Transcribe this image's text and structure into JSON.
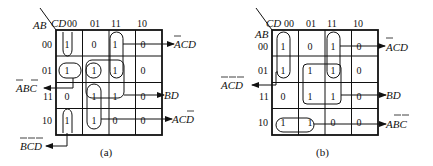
{
  "figure": {
    "maps": [
      {
        "id": "a",
        "caption": "(a)",
        "row_var": "AB",
        "col_var": "CD",
        "col_labels": [
          "00",
          "01",
          "11",
          "10"
        ],
        "row_labels": [
          "00",
          "01",
          "11",
          "10"
        ],
        "cells": [
          [
            "1",
            "0",
            "1",
            "0"
          ],
          [
            "1",
            "1",
            "1",
            "0"
          ],
          [
            "0",
            "1",
            "1",
            "0"
          ],
          [
            "1",
            "1",
            "0",
            "0"
          ]
        ],
        "groups": [
          {
            "term": "A̅C̅D",
            "term_text": "ĀCD (A bar C D)",
            "cells": "m1,m3 (col 11, rows 00-01)",
            "label": "ĀCD"
          },
          {
            "term": "ĀBC̄",
            "cells": "row 01, cols 00-01",
            "label": "ĀBC̄"
          },
          {
            "term": "BD",
            "cells": "rows 01-11, cols 01-11",
            "label": "BD"
          },
          {
            "term": "AC̄D",
            "cells": "col 01, rows 11-10",
            "label": "AC̄D"
          },
          {
            "term": "B̄C̄D̄",
            "cells": "col 00, rows 00 & 10",
            "label": "B̄C̄D̄"
          }
        ],
        "labels": {
          "acd_bar_a": "ACD",
          "abc": "ABC",
          "bd": "BD",
          "acd2": "ACD",
          "bcd": "BCD"
        }
      },
      {
        "id": "b",
        "caption": "(b)",
        "row_var": "AB",
        "col_var": "CD",
        "col_labels": [
          "00",
          "01",
          "11",
          "10"
        ],
        "row_labels": [
          "00",
          "01",
          "11",
          "10"
        ],
        "cells": [
          [
            "1",
            "0",
            "1",
            "0"
          ],
          [
            "1",
            "1",
            "1",
            "0"
          ],
          [
            "0",
            "1",
            "1",
            "0"
          ],
          [
            "1",
            "1",
            "0",
            "0"
          ]
        ],
        "labels": {
          "acd_top": "ACD",
          "acd_left": "ACD",
          "bd": "BD",
          "abc": "ABC"
        }
      }
    ]
  }
}
